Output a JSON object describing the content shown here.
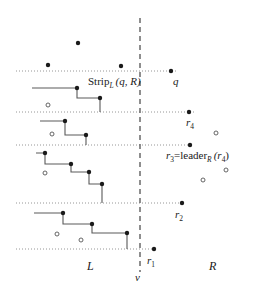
{
  "figure": {
    "width": 268,
    "height": 289,
    "colors": {
      "point_fill": "#1a1a1a",
      "point_open_stroke": "#555555",
      "stair_line": "#5a5a5a",
      "dotted_line": "#8a8a8a",
      "divider": "#6a6a6a",
      "text": "#1a1a1a",
      "background": "#ffffff"
    }
  },
  "labels": {
    "strip": {
      "text": "Strip",
      "sub": "L",
      "args": "(q, R)",
      "x": 88,
      "y": 83
    },
    "q": {
      "text": "q",
      "x": 176,
      "y": 75
    },
    "r4": {
      "text": "r",
      "sub": "4",
      "x": 190,
      "y": 118
    },
    "r3_leader": {
      "lhs": "r",
      "lhs_sub": "3",
      "eq": "=",
      "fn": "leader",
      "fn_sub": "R",
      "arg": "(r",
      "arg_sub": "4",
      "arg_close": ")",
      "x": 172,
      "y": 153
    },
    "r2": {
      "text": "r",
      "sub": "2",
      "x": 178,
      "y": 211
    },
    "r1": {
      "text": "r",
      "sub": "1",
      "x": 149,
      "y": 258
    },
    "L": {
      "text": "L",
      "x": 90,
      "y": 265
    },
    "R": {
      "text": "R",
      "x": 212,
      "y": 265
    },
    "v": {
      "text": "v",
      "x": 137,
      "y": 277
    }
  },
  "chart_data": {
    "type": "scatter",
    "xlabel": "",
    "ylabel": "",
    "xlim": [
      0,
      268
    ],
    "ylim": [
      0,
      289
    ],
    "grid": false,
    "legend": "none",
    "annotations": [
      "Strip_L (q, R)",
      "q",
      "r_4",
      "r_3 = leader_R (r_4)",
      "r_2",
      "r_1",
      "L",
      "R",
      "v"
    ],
    "divider": {
      "x": 140,
      "y_top": 18,
      "y_bottom": 272,
      "style": "dashed",
      "label": "v"
    },
    "horizontal_dotted_lines": [
      {
        "y": 71,
        "x_start": 16,
        "x_end": 176
      },
      {
        "y": 112,
        "x_start": 16,
        "x_end": 194
      },
      {
        "y": 145,
        "x_start": 16,
        "x_end": 190
      },
      {
        "y": 203,
        "x_start": 16,
        "x_end": 182
      },
      {
        "y": 249,
        "x_start": 16,
        "x_end": 154
      }
    ],
    "series": [
      {
        "name": "left-points-filled",
        "marker": "filled-circle",
        "points": [
          {
            "x": 48,
            "y": 65
          },
          {
            "x": 78,
            "y": 43
          },
          {
            "x": 121,
            "y": 66
          },
          {
            "x": 77,
            "y": 88
          },
          {
            "x": 100,
            "y": 98
          },
          {
            "x": 65,
            "y": 121
          },
          {
            "x": 86,
            "y": 135
          },
          {
            "x": 45,
            "y": 153
          },
          {
            "x": 71,
            "y": 164
          },
          {
            "x": 89,
            "y": 172
          },
          {
            "x": 102,
            "y": 184
          },
          {
            "x": 63,
            "y": 213
          },
          {
            "x": 92,
            "y": 224
          },
          {
            "x": 127,
            "y": 233
          }
        ]
      },
      {
        "name": "left-points-open",
        "marker": "open-circle",
        "points": [
          {
            "x": 48,
            "y": 105
          },
          {
            "x": 52,
            "y": 134
          },
          {
            "x": 45,
            "y": 173
          },
          {
            "x": 57,
            "y": 234
          },
          {
            "x": 81,
            "y": 240
          }
        ]
      },
      {
        "name": "right-points-filled",
        "marker": "filled-circle",
        "points": [
          {
            "x": 171,
            "y": 71
          },
          {
            "x": 189,
            "y": 112
          },
          {
            "x": 190,
            "y": 145
          },
          {
            "x": 182,
            "y": 203
          },
          {
            "x": 154,
            "y": 249
          }
        ]
      },
      {
        "name": "right-points-open",
        "marker": "open-circle",
        "points": [
          {
            "x": 216,
            "y": 133
          },
          {
            "x": 226,
            "y": 170
          },
          {
            "x": 203,
            "y": 180
          }
        ]
      }
    ],
    "staircases": [
      {
        "name": "staircase-1",
        "path": [
          {
            "x": 32,
            "y": 88
          },
          {
            "x": 77,
            "y": 88
          },
          {
            "x": 77,
            "y": 98
          },
          {
            "x": 100,
            "y": 98
          },
          {
            "x": 100,
            "y": 112
          }
        ]
      },
      {
        "name": "staircase-2",
        "path": [
          {
            "x": 40,
            "y": 121
          },
          {
            "x": 65,
            "y": 121
          },
          {
            "x": 65,
            "y": 135
          },
          {
            "x": 86,
            "y": 135
          },
          {
            "x": 86,
            "y": 145
          }
        ]
      },
      {
        "name": "staircase-3",
        "path": [
          {
            "x": 36,
            "y": 153
          },
          {
            "x": 45,
            "y": 153
          },
          {
            "x": 45,
            "y": 164
          },
          {
            "x": 71,
            "y": 164
          },
          {
            "x": 71,
            "y": 172
          },
          {
            "x": 89,
            "y": 172
          },
          {
            "x": 89,
            "y": 184
          },
          {
            "x": 102,
            "y": 184
          },
          {
            "x": 102,
            "y": 203
          }
        ]
      },
      {
        "name": "staircase-4",
        "path": [
          {
            "x": 34,
            "y": 213
          },
          {
            "x": 63,
            "y": 213
          },
          {
            "x": 63,
            "y": 224
          },
          {
            "x": 92,
            "y": 224
          },
          {
            "x": 92,
            "y": 233
          },
          {
            "x": 127,
            "y": 233
          },
          {
            "x": 127,
            "y": 249
          }
        ]
      }
    ]
  }
}
